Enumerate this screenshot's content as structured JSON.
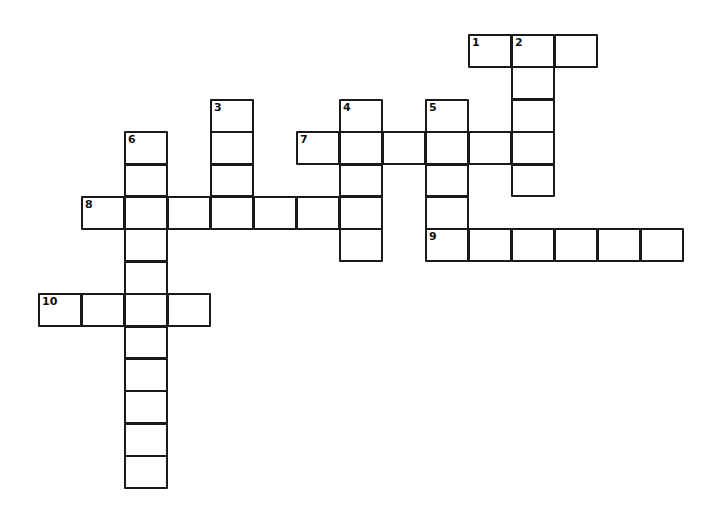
{
  "puzzle": {
    "type": "crossword",
    "cell_width": 43,
    "cell_height": 32.4,
    "origin_x": 38,
    "origin_y": 34,
    "entries": [
      {
        "number": "1",
        "direction": "across",
        "row": 0,
        "col": 10,
        "length": 3
      },
      {
        "number": "2",
        "direction": "down",
        "row": 0,
        "col": 11,
        "length": 5
      },
      {
        "number": "3",
        "direction": "down",
        "row": 2,
        "col": 4,
        "length": 4
      },
      {
        "number": "4",
        "direction": "down",
        "row": 2,
        "col": 7,
        "length": 5
      },
      {
        "number": "5",
        "direction": "down",
        "row": 2,
        "col": 9,
        "length": 5
      },
      {
        "number": "6",
        "direction": "down",
        "row": 3,
        "col": 2,
        "length": 11
      },
      {
        "number": "7",
        "direction": "across",
        "row": 3,
        "col": 6,
        "length": 6
      },
      {
        "number": "8",
        "direction": "across",
        "row": 5,
        "col": 1,
        "length": 7
      },
      {
        "number": "9",
        "direction": "across",
        "row": 6,
        "col": 9,
        "length": 6
      },
      {
        "number": "10",
        "direction": "across",
        "row": 8,
        "col": 0,
        "length": 4
      }
    ]
  }
}
